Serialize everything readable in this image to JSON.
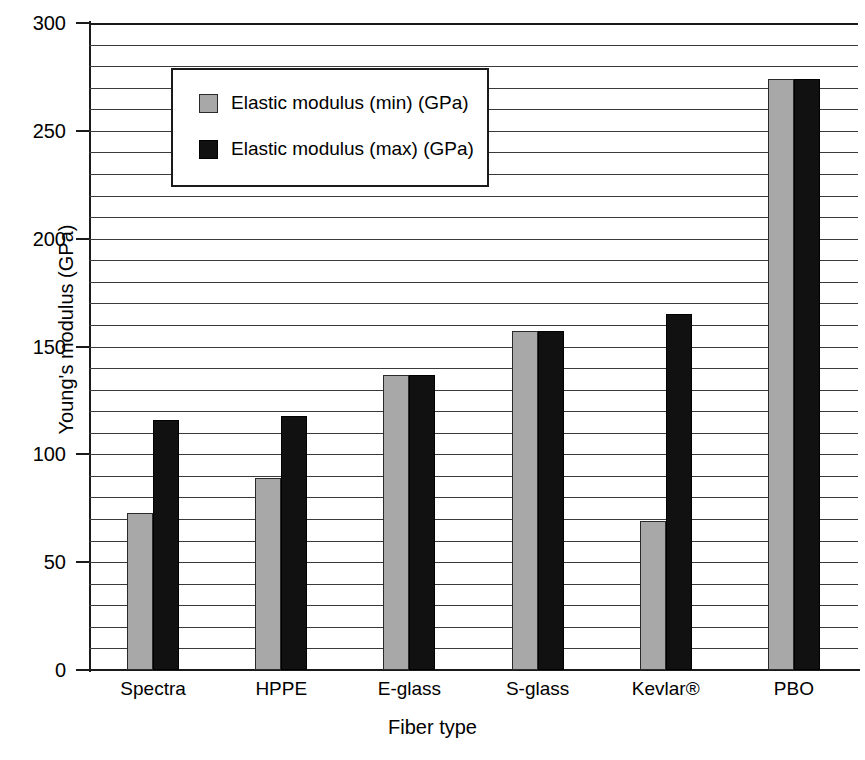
{
  "chart_data": {
    "type": "bar",
    "title": "",
    "xlabel": "Fiber type",
    "ylabel": "Young's modulus (GPa)",
    "categories": [
      "Spectra",
      "HPPE",
      "E-glass",
      "S-glass",
      "Kevlar®",
      "PBO"
    ],
    "series": [
      {
        "name": "Elastic modulus (min) (GPa)",
        "color": "#a8a8a8",
        "values": [
          73,
          89,
          137,
          157,
          69,
          274
        ]
      },
      {
        "name": "Elastic modulus (max) (GPa)",
        "color": "#111111",
        "values": [
          116,
          118,
          137,
          157,
          165,
          274
        ]
      }
    ],
    "ylim": [
      0,
      300
    ],
    "y_major_ticks": [
      0,
      50,
      100,
      150,
      200,
      250,
      300
    ],
    "y_major_tick_labels": [
      "0",
      "50",
      "100",
      "150",
      "200",
      "250",
      "300"
    ],
    "y_minor_tick_interval": 10,
    "grid": "horizontal",
    "legend_position": "top-left-inside"
  },
  "legend": {
    "entries": [
      {
        "label": "Elastic modulus (min) (GPa)",
        "swatch": "min"
      },
      {
        "label": "Elastic modulus (max) (GPa)",
        "swatch": "max"
      }
    ]
  },
  "axes": {
    "y_title": "Young's modulus (GPa)",
    "x_title": "Fiber type"
  }
}
